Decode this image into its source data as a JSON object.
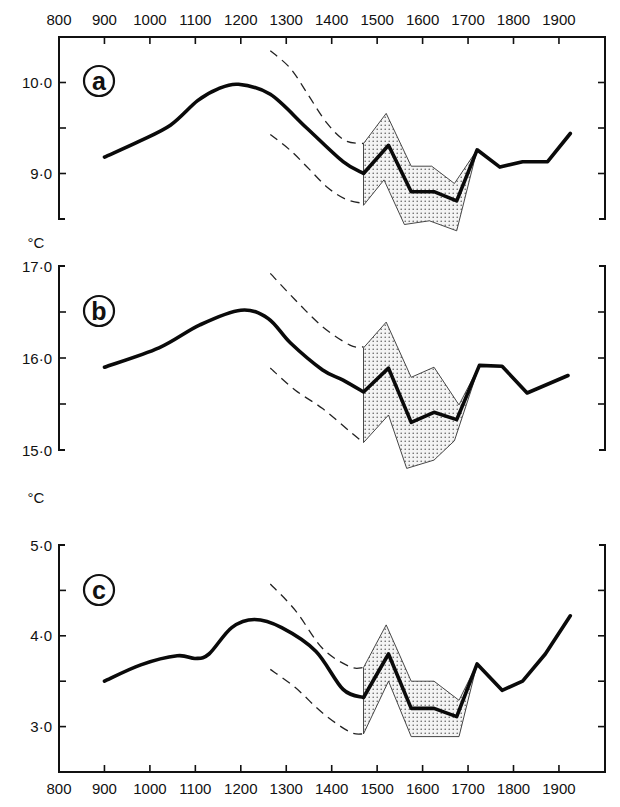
{
  "figure": {
    "unit_label": "°C",
    "x_tick_labels": [
      "800",
      "900",
      "1000",
      "1100",
      "1200",
      "1300",
      "1400",
      "1500",
      "1600",
      "1700",
      "1800",
      "1900"
    ]
  },
  "chart_data": [
    {
      "type": "line",
      "panel": "a",
      "title": "",
      "xlabel": "",
      "ylabel": "°C",
      "xlim": [
        800,
        2000
      ],
      "ylim": [
        8.5,
        10.5
      ],
      "x_ticks": [
        800,
        900,
        1000,
        1100,
        1200,
        1300,
        1400,
        1500,
        1600,
        1700,
        1800,
        1900
      ],
      "y_ticks": [
        8.5,
        9.0,
        9.5,
        10.0,
        10.5
      ],
      "y_tick_labels": {
        "9.0": "9·0",
        "10.0": "10·0"
      },
      "grid": false,
      "series": [
        {
          "name": "mean temperature",
          "style": "solid-thick",
          "x": [
            900,
            975,
            1045,
            1105,
            1150,
            1195,
            1265,
            1345,
            1425,
            1470,
            1525,
            1575,
            1625,
            1675,
            1720,
            1770,
            1820,
            1875,
            1925
          ],
          "y": [
            9.18,
            9.35,
            9.53,
            9.8,
            9.93,
            9.98,
            9.87,
            9.5,
            9.13,
            9.0,
            9.31,
            8.8,
            8.8,
            8.7,
            9.26,
            9.07,
            9.13,
            9.13,
            9.44
          ]
        },
        {
          "name": "upper bound (dashed)",
          "style": "dashed",
          "x": [
            1265,
            1310,
            1350,
            1390,
            1430,
            1470
          ],
          "y": [
            10.35,
            10.15,
            9.85,
            9.55,
            9.36,
            9.33
          ]
        },
        {
          "name": "lower bound (dashed)",
          "style": "dashed",
          "x": [
            1265,
            1310,
            1350,
            1390,
            1430,
            1470
          ],
          "y": [
            9.43,
            9.25,
            9.05,
            8.85,
            8.72,
            8.67
          ]
        },
        {
          "name": "range upper (stippled)",
          "style": "band-upper",
          "x": [
            1470,
            1520,
            1575,
            1620,
            1670,
            1720
          ],
          "y": [
            9.33,
            9.66,
            9.08,
            9.08,
            8.89,
            9.26
          ]
        },
        {
          "name": "range lower (stippled)",
          "style": "band-lower",
          "x": [
            1470,
            1515,
            1560,
            1615,
            1675,
            1720
          ],
          "y": [
            8.65,
            8.93,
            8.44,
            8.48,
            8.37,
            9.26
          ]
        }
      ]
    },
    {
      "type": "line",
      "panel": "b",
      "title": "",
      "xlabel": "",
      "ylabel": "°C",
      "xlim": [
        800,
        2000
      ],
      "ylim": [
        15.0,
        17.0
      ],
      "x_ticks": [
        800,
        900,
        1000,
        1100,
        1200,
        1300,
        1400,
        1500,
        1600,
        1700,
        1800,
        1900
      ],
      "y_ticks": [
        15.0,
        15.5,
        16.0,
        16.5,
        17.0
      ],
      "y_tick_labels": {
        "15.0": "15·0",
        "16.0": "16·0",
        "17.0": "17·0"
      },
      "grid": false,
      "series": [
        {
          "name": "mean temperature",
          "style": "solid-thick",
          "x": [
            900,
            1020,
            1110,
            1200,
            1260,
            1310,
            1380,
            1425,
            1470,
            1525,
            1575,
            1625,
            1675,
            1725,
            1775,
            1830,
            1920
          ],
          "y": [
            15.9,
            16.11,
            16.36,
            16.52,
            16.43,
            16.16,
            15.87,
            15.76,
            15.63,
            15.89,
            15.3,
            15.41,
            15.33,
            15.92,
            15.91,
            15.62,
            15.81
          ]
        },
        {
          "name": "upper bound (dashed)",
          "style": "dashed",
          "x": [
            1265,
            1320,
            1380,
            1440,
            1470
          ],
          "y": [
            16.92,
            16.63,
            16.34,
            16.14,
            16.12
          ]
        },
        {
          "name": "lower bound (dashed)",
          "style": "dashed",
          "x": [
            1265,
            1320,
            1380,
            1440,
            1470
          ],
          "y": [
            15.89,
            15.65,
            15.45,
            15.2,
            15.08
          ]
        },
        {
          "name": "range upper (stippled)",
          "style": "band-upper",
          "x": [
            1470,
            1520,
            1575,
            1625,
            1680,
            1725
          ],
          "y": [
            16.11,
            16.39,
            15.79,
            15.9,
            15.49,
            15.92
          ]
        },
        {
          "name": "range lower (stippled)",
          "style": "band-lower",
          "x": [
            1470,
            1525,
            1565,
            1625,
            1670,
            1725
          ],
          "y": [
            15.08,
            15.38,
            14.8,
            14.89,
            15.1,
            15.92
          ]
        }
      ]
    },
    {
      "type": "line",
      "panel": "c",
      "title": "",
      "xlabel": "",
      "ylabel": "°C",
      "xlim": [
        800,
        2000
      ],
      "ylim": [
        2.5,
        5.0
      ],
      "x_ticks": [
        800,
        900,
        1000,
        1100,
        1200,
        1300,
        1400,
        1500,
        1600,
        1700,
        1800,
        1900
      ],
      "y_ticks": [
        2.5,
        3.0,
        3.5,
        4.0,
        4.5,
        5.0
      ],
      "y_tick_labels": {
        "3.0": "3·0",
        "4.0": "4·0",
        "5.0": "5·0"
      },
      "grid": false,
      "series": [
        {
          "name": "mean temperature",
          "style": "solid-thick",
          "x": [
            900,
            980,
            1060,
            1100,
            1130,
            1180,
            1230,
            1290,
            1365,
            1425,
            1470,
            1525,
            1575,
            1625,
            1675,
            1720,
            1775,
            1820,
            1870,
            1925
          ],
          "y": [
            3.5,
            3.68,
            3.78,
            3.75,
            3.8,
            4.09,
            4.18,
            4.09,
            3.83,
            3.41,
            3.32,
            3.8,
            3.2,
            3.2,
            3.11,
            3.69,
            3.4,
            3.5,
            3.8,
            4.22
          ]
        },
        {
          "name": "upper bound (dashed)",
          "style": "dashed",
          "x": [
            1265,
            1320,
            1380,
            1440,
            1470
          ],
          "y": [
            4.57,
            4.28,
            3.86,
            3.66,
            3.65
          ]
        },
        {
          "name": "lower bound (dashed)",
          "style": "dashed",
          "x": [
            1265,
            1320,
            1380,
            1440,
            1470
          ],
          "y": [
            3.63,
            3.43,
            3.15,
            2.94,
            2.92
          ]
        },
        {
          "name": "range upper (stippled)",
          "style": "band-upper",
          "x": [
            1470,
            1520,
            1575,
            1625,
            1680,
            1720
          ],
          "y": [
            3.65,
            4.12,
            3.5,
            3.5,
            3.29,
            3.69
          ]
        },
        {
          "name": "range lower (stippled)",
          "style": "band-lower",
          "x": [
            1470,
            1525,
            1575,
            1680,
            1720
          ],
          "y": [
            2.92,
            3.5,
            2.89,
            2.89,
            3.69
          ]
        }
      ]
    }
  ]
}
